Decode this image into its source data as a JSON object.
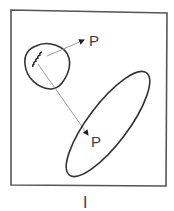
{
  "figure": {
    "caption": "I",
    "labels": {
      "upper_point": "P",
      "lower_point": "P"
    },
    "colors": {
      "stroke": "#333333",
      "frame": "#555555",
      "arrow_line": "#9a9a9a",
      "background": "#ffffff"
    },
    "shapes": [
      {
        "id": "small-region",
        "type": "closed-curve",
        "note": "rounded blob containing a wavy mark"
      },
      {
        "id": "large-region",
        "type": "ellipse",
        "note": "tilted elongated ellipse"
      }
    ],
    "arrows": [
      {
        "from": "wavy-mark",
        "to": "upper P",
        "direction": "up-right"
      },
      {
        "from": "wavy-mark",
        "to": "lower P",
        "direction": "down-right",
        "crosses": "ellipse boundary"
      }
    ]
  }
}
